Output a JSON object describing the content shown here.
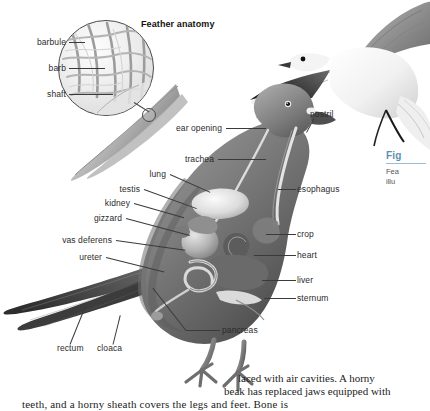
{
  "page": {
    "background": "#ffffff",
    "label_color": "#2b2b2b",
    "leader_color": "#3a3a3a",
    "caption_accent": "#5d8fb5"
  },
  "feather_inset": {
    "title": "Feather anatomy",
    "labels": [
      {
        "name": "barbule",
        "text": "barbule"
      },
      {
        "name": "barb",
        "text": "barb"
      },
      {
        "name": "shaft",
        "text": "shaft"
      }
    ]
  },
  "bird_diagram": {
    "left_labels": [
      {
        "name": "ear-opening",
        "text": "ear opening"
      },
      {
        "name": "trachea",
        "text": "trachea"
      },
      {
        "name": "lung",
        "text": "lung"
      },
      {
        "name": "testis",
        "text": "testis"
      },
      {
        "name": "kidney",
        "text": "kidney"
      },
      {
        "name": "gizzard",
        "text": "gizzard"
      },
      {
        "name": "vas-deferens",
        "text": "vas deferens"
      },
      {
        "name": "ureter",
        "text": "ureter"
      }
    ],
    "right_labels": [
      {
        "name": "nostril",
        "text": "nostril"
      },
      {
        "name": "esophagus",
        "text": "esophagus"
      },
      {
        "name": "crop",
        "text": "crop"
      },
      {
        "name": "heart",
        "text": "heart"
      },
      {
        "name": "liver",
        "text": "liver"
      },
      {
        "name": "sternum",
        "text": "sternum"
      },
      {
        "name": "pancreas",
        "text": "pancreas"
      }
    ],
    "bottom_labels": [
      {
        "name": "rectum",
        "text": "rectum"
      },
      {
        "name": "cloaca",
        "text": "cloaca"
      }
    ]
  },
  "figure_caption": {
    "fig_label": "Fig",
    "line1": "Fea",
    "line2": "illu"
  },
  "body_text": {
    "line1": "laced with air cavities. A horny",
    "line2": "beak has replaced jaws equipped with",
    "line3": "teeth, and a horny sheath covers the legs and feet. Bone is"
  }
}
